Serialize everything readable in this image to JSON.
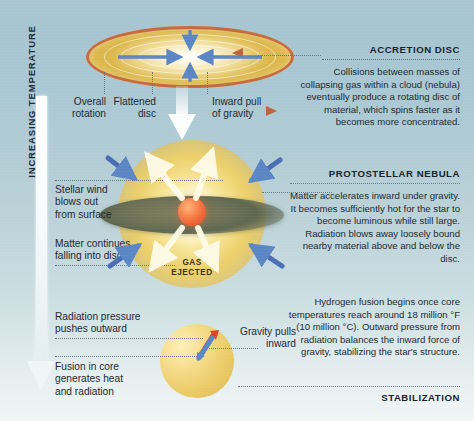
{
  "figure": {
    "axis_label": "INCREASING TEMPERATURE",
    "colors": {
      "background_top": "#a9c6d2",
      "background_bottom": "#f1f6f6",
      "disc_outline": "#c2623c",
      "disc_fill": "#ecd485",
      "inward_arrow_blue": "#5b86c4",
      "outward_arrow_white": "#fffbe8",
      "nebula_glow": "#f6e291",
      "nebula_disc": "#6f7256",
      "protostar_core": "#ec5f31",
      "star_body": "#eccd6c",
      "outward_arrow_red": "#d9452f",
      "text": "#1b2831"
    }
  },
  "stage1": {
    "heading": "ACCRETION DISC",
    "body": "Collisions between masses of collapsing gas within a cloud (nebula) eventually produce a rotating disc of material, which spins faster as it becomes more concentrated.",
    "labels": {
      "rotation": "Overall\nrotation",
      "flattened": "Flattened\ndisc",
      "gravity": "Inward pull\nof gravity"
    }
  },
  "stage2": {
    "heading": "PROTOSTELLAR NEBULA",
    "body": "Matter accelerates inward under gravity. It becomes sufficiently hot for the star to become luminous while still large. Radiation blows away loosely bound nearby material above and below the disc.",
    "labels": {
      "stellar_wind": "Stellar wind\nblows out\nfrom surface",
      "matter_falling": "Matter continues\nfalling into disc",
      "gas_ejected": "GAS\nEJECTED"
    }
  },
  "stage3": {
    "heading": "STABILIZATION",
    "body": "Hydrogen fusion begins once core temperatures reach around 18 million °F (10 million °C). Outward pressure from radiation balances the inward force of gravity, stabilizing the star's structure.",
    "labels": {
      "radiation_pressure": "Radiation pressure\npushes outward",
      "fusion": "Fusion in core\ngenerates heat\nand radiation",
      "gravity_pulls": "Gravity pulls\ninward"
    }
  }
}
